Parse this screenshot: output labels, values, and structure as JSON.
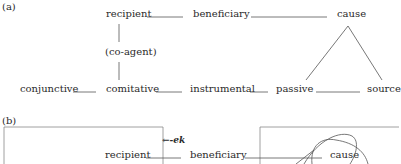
{
  "panel_a": {
    "label": "(a)",
    "nodes": {
      "recipient": "recipient",
      "beneficiary": "beneficiary",
      "cause": "cause",
      "co_agent": "(co-agent)",
      "conjunctive": "conjunctive",
      "comitative": "comitative",
      "instrumental": "instrumental",
      "passive": "passive",
      "source": "source"
    }
  },
  "panel_b": {
    "label": "(b)",
    "marker": "←-ek",
    "nodes": {
      "recipient": "recipient",
      "beneficiary": "beneficiary",
      "cause": "cause"
    }
  },
  "colors": {
    "text": "#2a2a2a",
    "line": "#555555",
    "box": "#888888"
  }
}
